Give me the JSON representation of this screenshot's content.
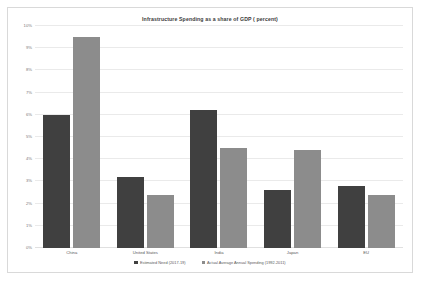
{
  "chart_data": {
    "type": "bar",
    "title": "Infrastructure Spending as a share of GDP ( percent)",
    "xlabel": "",
    "ylabel": "",
    "ylim": [
      0,
      10
    ],
    "ytick_step": 1,
    "grid": true,
    "legend_position": "bottom",
    "categories": [
      "China",
      "United States",
      "India",
      "Japan",
      "EU"
    ],
    "ytick_labels": [
      "0%",
      "1%",
      "2%",
      "3%",
      "4%",
      "5%",
      "6%",
      "7%",
      "8%",
      "9%",
      "10%"
    ],
    "series": [
      {
        "name": "Estimated Need (2017-19)",
        "color": "#404040",
        "values": [
          6.0,
          3.2,
          6.2,
          2.6,
          2.8
        ]
      },
      {
        "name": "Actual Average Annual Spending (1992-2011)",
        "color": "#8c8c8c",
        "values": [
          9.5,
          2.4,
          4.5,
          4.4,
          2.4
        ]
      }
    ]
  }
}
